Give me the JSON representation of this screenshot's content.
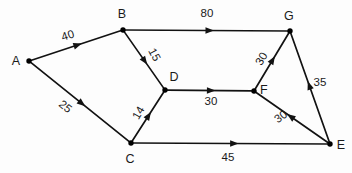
{
  "figure": {
    "kind": "directed-weighted-graph",
    "background_color": "#fdfdfd",
    "stroke_color": "#121212",
    "text_color": "#1a1a1a",
    "width": 352,
    "height": 173
  },
  "nodes": [
    {
      "id": "A",
      "label": "A",
      "x": 29,
      "y": 61,
      "label_x": 16,
      "label_y": 61
    },
    {
      "id": "B",
      "label": "B",
      "x": 123,
      "y": 30,
      "label_x": 122,
      "label_y": 14
    },
    {
      "id": "C",
      "label": "C",
      "x": 131,
      "y": 143,
      "label_x": 130,
      "label_y": 159
    },
    {
      "id": "D",
      "label": "D",
      "x": 165,
      "y": 90,
      "label_x": 174,
      "label_y": 77
    },
    {
      "id": "E",
      "label": "E",
      "x": 330,
      "y": 144,
      "label_x": 341,
      "label_y": 145
    },
    {
      "id": "F",
      "label": "F",
      "x": 254,
      "y": 91,
      "label_x": 264,
      "label_y": 90
    },
    {
      "id": "G",
      "label": "G",
      "x": 290,
      "y": 31,
      "label_x": 289,
      "label_y": 16
    }
  ],
  "edges": [
    {
      "id": "A-B",
      "from": "A",
      "to": "B",
      "weight": "40",
      "directed": true,
      "label_x": 68,
      "label_y": 36,
      "label_rotation": -18
    },
    {
      "id": "A-C",
      "from": "A",
      "to": "C",
      "weight": "25",
      "directed": true,
      "label_x": 65,
      "label_y": 107,
      "label_rotation": 39
    },
    {
      "id": "B-G",
      "from": "B",
      "to": "G",
      "weight": "80",
      "directed": true,
      "label_x": 207,
      "label_y": 14,
      "label_rotation": 0
    },
    {
      "id": "B-D",
      "from": "B",
      "to": "D",
      "weight": "15",
      "directed": true,
      "label_x": 154,
      "label_y": 55,
      "label_rotation": 62
    },
    {
      "id": "C-D",
      "from": "C",
      "to": "D",
      "weight": "14",
      "directed": true,
      "label_x": 139,
      "label_y": 113,
      "label_rotation": -60
    },
    {
      "id": "C-E",
      "from": "C",
      "to": "E",
      "weight": "45",
      "directed": true,
      "label_x": 228,
      "label_y": 158,
      "label_rotation": 0
    },
    {
      "id": "D-F",
      "from": "D",
      "to": "F",
      "weight": "30",
      "directed": true,
      "label_x": 211,
      "label_y": 102,
      "label_rotation": 0
    },
    {
      "id": "E-F",
      "from": "E",
      "to": "F",
      "weight": "30",
      "directed": true,
      "label_x": 281,
      "label_y": 117,
      "label_rotation": -36
    },
    {
      "id": "E-G",
      "from": "E",
      "to": "G",
      "weight": "35",
      "directed": true,
      "label_x": 320,
      "label_y": 83,
      "label_rotation": 0
    },
    {
      "id": "F-G",
      "from": "F",
      "to": "G",
      "weight": "30",
      "directed": true,
      "label_x": 262,
      "label_y": 59,
      "label_rotation": -60
    }
  ]
}
